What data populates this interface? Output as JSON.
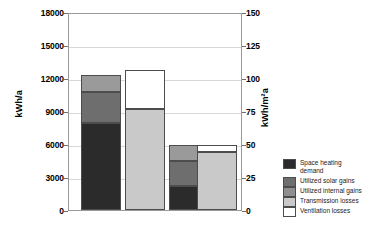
{
  "chart_data": {
    "type": "bar",
    "title": "",
    "subtitle": "",
    "stacked": true,
    "grid": true,
    "categories": [
      "Bar 1",
      "Bar 2",
      "Bar 3",
      "Bar 4"
    ],
    "ylabel": "kWh/a",
    "ylabel_secondary": "kWh/m²a",
    "ylim": [
      0,
      18000
    ],
    "ylim_secondary": [
      0,
      150
    ],
    "yticks": [
      0,
      3000,
      6000,
      9000,
      12000,
      15000,
      18000
    ],
    "ytick_labels": [
      "0",
      "3000",
      "6000",
      "9000",
      "12000",
      "15000",
      "18000"
    ],
    "yticks_secondary": [
      0,
      25,
      50,
      75,
      100,
      125,
      150
    ],
    "ytick_labels_secondary": [
      "0",
      "25",
      "50",
      "75",
      "100",
      "125",
      "150"
    ],
    "xlabel": "",
    "xtick_labels": [
      "",
      "",
      "",
      ""
    ],
    "legend_position": "right",
    "series": [
      {
        "name": "Space heating demand",
        "color": "#2b2b2b",
        "values": [
          7900,
          0,
          2150,
          0
        ]
      },
      {
        "name": "Utilized solar gains",
        "color": "#6e6e6e",
        "values": [
          2800,
          0,
          2300,
          0
        ]
      },
      {
        "name": "Utilized internal gains",
        "color": "#9a9a9a",
        "values": [
          1600,
          0,
          1450,
          0
        ]
      },
      {
        "name": "Transmission losses",
        "color": "#c9c9c9",
        "values": [
          0,
          9200,
          0,
          5250
        ]
      },
      {
        "name": "Ventilation losses",
        "color": "#ffffff",
        "values": [
          0,
          3500,
          0,
          700
        ]
      }
    ],
    "bars": [
      {
        "label": "Bar 1",
        "total": 12300,
        "segments": [
          {
            "series": "Space heating demand",
            "value": 7900,
            "color": "#2b2b2b"
          },
          {
            "series": "Utilized solar gains",
            "value": 2800,
            "color": "#6e6e6e"
          },
          {
            "series": "Utilized internal gains",
            "value": 1600,
            "color": "#9a9a9a"
          }
        ]
      },
      {
        "label": "Bar 2",
        "total": 12700,
        "segments": [
          {
            "series": "Transmission losses",
            "value": 9200,
            "color": "#c9c9c9"
          },
          {
            "series": "Ventilation losses",
            "value": 3500,
            "color": "#ffffff"
          }
        ]
      },
      {
        "label": "Bar 3",
        "total": 5900,
        "segments": [
          {
            "series": "Space heating demand",
            "value": 2150,
            "color": "#2b2b2b"
          },
          {
            "series": "Utilized solar gains",
            "value": 2300,
            "color": "#6e6e6e"
          },
          {
            "series": "Utilized internal gains",
            "value": 1450,
            "color": "#9a9a9a"
          }
        ]
      },
      {
        "label": "Bar 4",
        "total": 5950,
        "segments": [
          {
            "series": "Transmission losses",
            "value": 5250,
            "color": "#c9c9c9"
          },
          {
            "series": "Ventilation losses",
            "value": 700,
            "color": "#ffffff"
          }
        ]
      }
    ],
    "legend": [
      {
        "label": "Space heating\ndemand",
        "color": "#2b2b2b"
      },
      {
        "label": "Utilized solar gains",
        "color": "#6e6e6e"
      },
      {
        "label": "Utilized internal gains",
        "color": "#8f8f8f"
      },
      {
        "label": "Transmission losses",
        "color": "#c9c9c9"
      },
      {
        "label": "Ventilation losses",
        "color": "#ffffff"
      }
    ]
  }
}
